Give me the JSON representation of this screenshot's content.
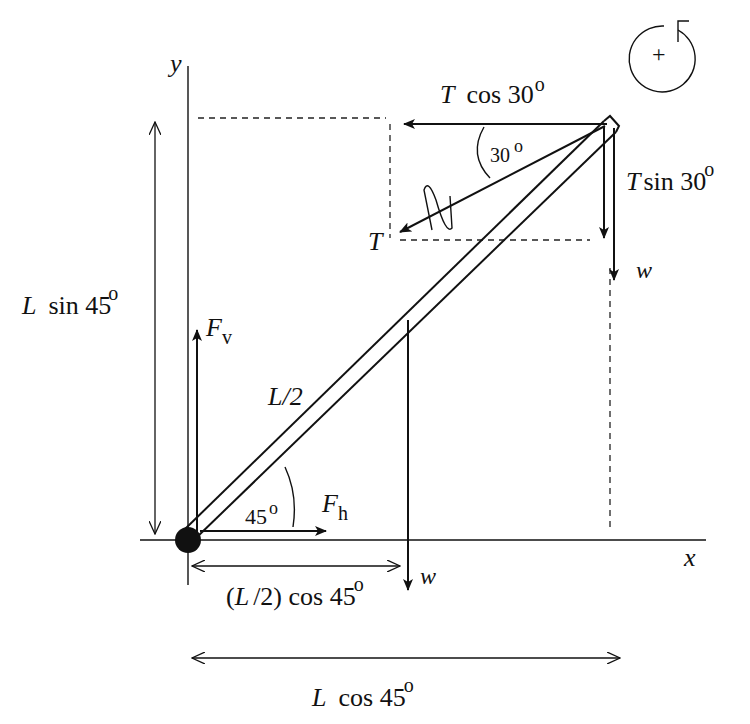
{
  "diagram": {
    "type": "free-body diagram of beam",
    "axes": {
      "x_label": "x",
      "y_label": "y"
    },
    "rotation_sign": {
      "symbol": "+",
      "direction": "counterclockwise"
    },
    "beam": {
      "angle_label": "45",
      "half_length_label": "L/2"
    },
    "forces": {
      "tension": {
        "symbol": "T",
        "angle_label": "30"
      },
      "tension_horizontal": {
        "symbol": "T",
        "text": "cos 30",
        "degree": "o"
      },
      "tension_vertical": {
        "symbol": "T",
        "text": "sin 30",
        "degree": "o"
      },
      "weight_end": {
        "symbol": "w"
      },
      "weight_center": {
        "symbol": "w"
      },
      "vertical_reaction": {
        "symbol": "F",
        "subscript": "v"
      },
      "horizontal_reaction": {
        "symbol": "F",
        "subscript": "h"
      }
    },
    "dimensions": {
      "height": {
        "symbol": "L",
        "text": "sin 45",
        "degree": "o"
      },
      "half_horizontal": {
        "prefix": "(",
        "symbol": "L",
        "text": "/2) cos 45",
        "degree": "o"
      },
      "full_horizontal": {
        "symbol": "L",
        "text": "cos 45",
        "degree": "o"
      }
    },
    "degree_mark": "o"
  }
}
